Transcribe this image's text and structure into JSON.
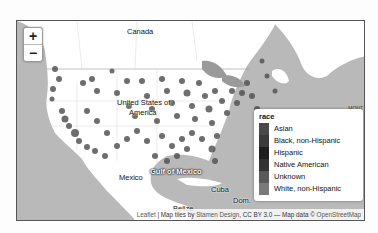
{
  "map": {
    "zoom_in_label": "+",
    "zoom_out_label": "−",
    "place_labels": {
      "canada": "Canada",
      "usa_line1": "United States of",
      "usa_line2": "America",
      "gulf": "Gulf of Mexico",
      "mexico": "Mexico",
      "cuba": "Cuba",
      "dom": "Dom.",
      "belize": "Belize",
      "corner": "MONT"
    },
    "legend": {
      "title": "race",
      "items": [
        {
          "label": "Asian",
          "color": "#4a4a4a"
        },
        {
          "label": "Black, non-Hispanic",
          "color": "#3a3a3a"
        },
        {
          "label": "Hispanic",
          "color": "#1e1e1e"
        },
        {
          "label": "Native American",
          "color": "#333333"
        },
        {
          "label": "Unknown",
          "color": "#5a5a5a"
        },
        {
          "label": "White, non-Hispanic",
          "color": "#7a7a7a"
        }
      ]
    },
    "attribution": {
      "leaflet": "Leaflet",
      "sep": " | Map tiles by ",
      "stamen": "Stamen Design",
      "cc": ", CC BY 3.0",
      "dash": " — Map data © ",
      "osm": "OpenStreetMap"
    }
  }
}
